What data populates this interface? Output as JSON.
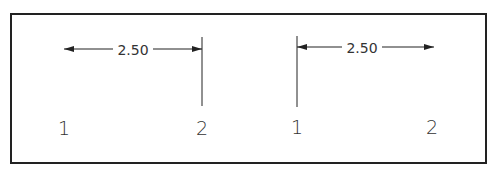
{
  "diagram": {
    "frame": {
      "x": 11,
      "y": 14,
      "width": 475,
      "height": 149,
      "stroke": "#222222"
    },
    "colors": {
      "line": "#222222",
      "text": "#333333",
      "background": "#ffffff"
    },
    "left_example": {
      "dimension_text": "2.50",
      "point_1_label": "1",
      "point_2_label": "2",
      "arrow_start_x": 64,
      "arrow_end_x": 202,
      "arrow_y": 49,
      "extension_line": {
        "x": 202,
        "y1": 37,
        "y2": 106
      },
      "text_x": 133,
      "point_1_x": 64,
      "point_2_x": 202
    },
    "right_example": {
      "dimension_text": "2.50",
      "point_1_label": "1",
      "point_2_label": "2",
      "arrow_start_x": 297,
      "arrow_end_x": 434,
      "arrow_y": 47,
      "extension_line": {
        "x": 297,
        "y1": 36,
        "y2": 107
      },
      "text_x": 362,
      "point_1_x": 297,
      "point_2_x": 432
    }
  }
}
